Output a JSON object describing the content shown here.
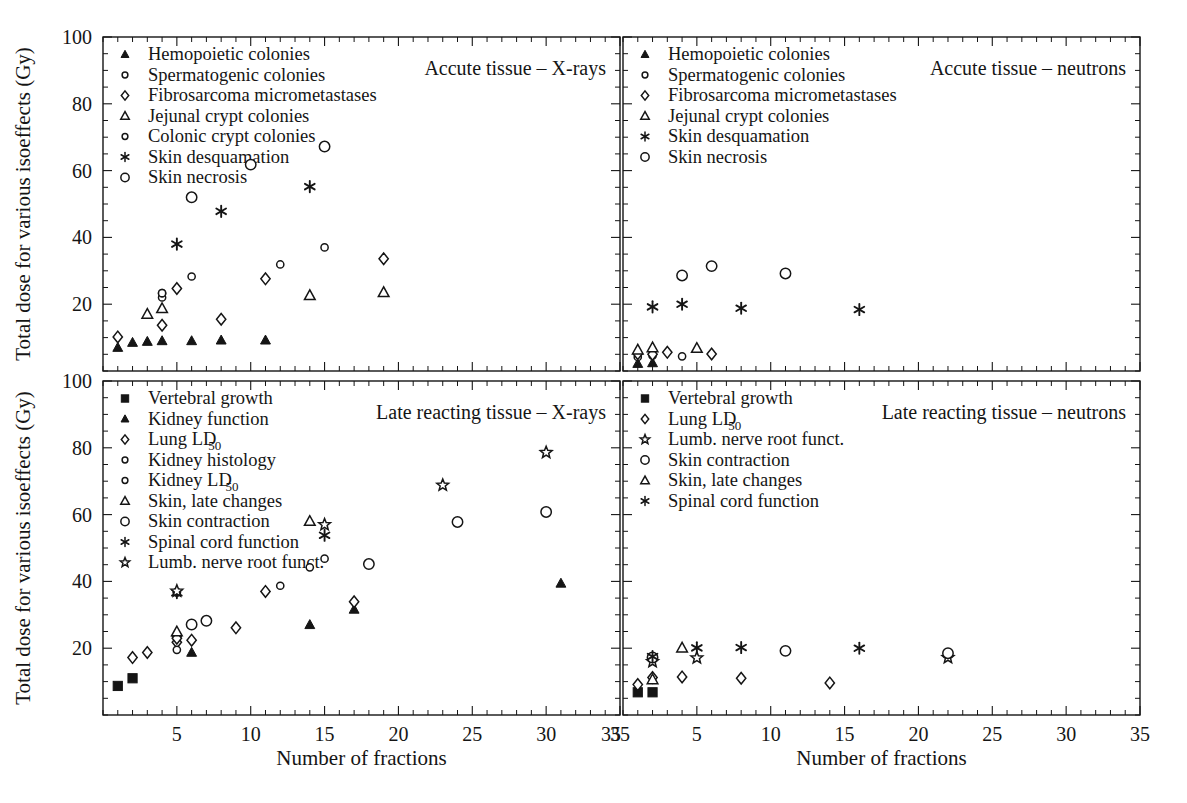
{
  "figure": {
    "width": 1187,
    "height": 803,
    "background": "#ffffff",
    "ink_color": "#151515"
  },
  "axes": {
    "x_title": "Number of fractions",
    "y_title": "Total dose for various isoeffects (Gy)",
    "x_ticks": [
      5,
      10,
      15,
      20,
      25,
      30,
      35
    ],
    "x_tick_labels": [
      "5",
      "10",
      "15",
      "20",
      "25",
      "30",
      "35"
    ],
    "x_range": [
      0,
      35
    ],
    "y_ticks": [
      20,
      40,
      60,
      80,
      100
    ],
    "y_tick_labels": [
      "20",
      "40",
      "60",
      "80",
      "100"
    ],
    "y_range": [
      0,
      100
    ],
    "x_minor_interval": 1,
    "y_minor_interval": 5,
    "grid": "off"
  },
  "chart_data": [
    {
      "type": "scatter",
      "panel": "top-left",
      "title": "Accute tissue – X-rays",
      "xlabel": "Number of fractions",
      "ylabel": "Total dose for various isoeffects (Gy)",
      "xlim": [
        0,
        35
      ],
      "ylim": [
        0,
        100
      ],
      "legend_position": "top-left",
      "series": [
        {
          "name": "Hemopoietic colonies",
          "marker": "filled-triangle",
          "points": [
            [
              1,
              7.0
            ],
            [
              2,
              8.5
            ],
            [
              3,
              8.8
            ],
            [
              4,
              9.0
            ],
            [
              6,
              9.0
            ],
            [
              8,
              9.2
            ],
            [
              11,
              9.2
            ]
          ]
        },
        {
          "name": "Spermatogenic colonies",
          "marker": "small-circle",
          "points": [
            [
              4,
              22.0
            ],
            [
              4,
              23.3
            ]
          ]
        },
        {
          "name": "Fibrosarcoma micrometastases",
          "marker": "diamond",
          "points": [
            [
              1,
              10.2
            ],
            [
              4,
              13.7
            ],
            [
              5,
              24.7
            ],
            [
              8,
              15.5
            ],
            [
              11,
              27.6
            ],
            [
              19,
              33.6
            ]
          ]
        },
        {
          "name": "Jejunal crypt colonies",
          "marker": "triangle",
          "points": [
            [
              3,
              17.0
            ],
            [
              4,
              18.7
            ],
            [
              14,
              22.6
            ],
            [
              19,
              23.5
            ]
          ]
        },
        {
          "name": "Colonic crypt colonies",
          "marker": "small-circle",
          "points": [
            [
              4,
              23.3
            ],
            [
              6,
              28.3
            ],
            [
              12,
              31.9
            ],
            [
              15,
              37.0
            ]
          ]
        },
        {
          "name": "Skin desquamation",
          "marker": "asterisk",
          "points": [
            [
              5,
              38.0
            ],
            [
              8,
              47.8
            ],
            [
              14,
              55.2
            ]
          ]
        },
        {
          "name": "Skin necrosis",
          "marker": "circle",
          "points": [
            [
              6,
              52.0
            ],
            [
              10,
              61.8
            ],
            [
              15,
              67.2
            ]
          ]
        }
      ]
    },
    {
      "type": "scatter",
      "panel": "top-right",
      "title": "Accute tissue – neutrons",
      "xlabel": "Number of fractions",
      "ylabel": "Total dose for various isoeffects (Gy)",
      "xlim": [
        0,
        35
      ],
      "ylim": [
        0,
        100
      ],
      "legend_position": "top-left",
      "series": [
        {
          "name": "Hemopoietic colonies",
          "marker": "filled-triangle",
          "points": [
            [
              1,
              2.2
            ],
            [
              2,
              2.4
            ]
          ]
        },
        {
          "name": "Spermatogenic colonies",
          "marker": "small-circle",
          "points": [
            [
              1,
              4.2
            ],
            [
              2,
              4.6
            ],
            [
              4,
              4.4
            ]
          ]
        },
        {
          "name": "Fibrosarcoma micrometastases",
          "marker": "diamond",
          "points": [
            [
              1,
              5.2
            ],
            [
              2,
              5.0
            ],
            [
              3,
              5.6
            ],
            [
              6,
              5.1
            ]
          ]
        },
        {
          "name": "Jejunal crypt colonies",
          "marker": "triangle",
          "points": [
            [
              1,
              6.3
            ],
            [
              2,
              7.0
            ],
            [
              5,
              6.8
            ]
          ]
        },
        {
          "name": "Skin desquamation",
          "marker": "asterisk",
          "points": [
            [
              2,
              19.2
            ],
            [
              4,
              20.0
            ],
            [
              8,
              18.8
            ],
            [
              16,
              18.4
            ]
          ]
        },
        {
          "name": "Skin necrosis",
          "marker": "circle",
          "points": [
            [
              4,
              28.6
            ],
            [
              6,
              31.4
            ],
            [
              11,
              29.2
            ]
          ]
        }
      ]
    },
    {
      "type": "scatter",
      "panel": "bottom-left",
      "title": "Late reacting tissue – X-rays",
      "xlabel": "Number of fractions",
      "ylabel": "Total dose for various isoeffects (Gy)",
      "xlim": [
        0,
        35
      ],
      "ylim": [
        0,
        100
      ],
      "legend_position": "top-left",
      "series": [
        {
          "name": "Vertebral growth",
          "marker": "filled-square",
          "points": [
            [
              1,
              8.7
            ],
            [
              2,
              11.0
            ]
          ]
        },
        {
          "name": "Kidney function",
          "marker": "filled-triangle",
          "points": [
            [
              5,
              24.5
            ],
            [
              6,
              18.7
            ],
            [
              14,
              27.0
            ],
            [
              17,
              31.6
            ],
            [
              31,
              39.4
            ]
          ]
        },
        {
          "name": "Lung LD50",
          "marker": "diamond",
          "points": [
            [
              2,
              17.2
            ],
            [
              3,
              18.7
            ],
            [
              5,
              21.8
            ],
            [
              5,
              23.0
            ],
            [
              6,
              22.4
            ],
            [
              9,
              26.1
            ],
            [
              11,
              37.0
            ],
            [
              17,
              33.9
            ]
          ]
        },
        {
          "name": "Kidney histology",
          "marker": "small-circle",
          "points": [
            [
              5,
              19.5
            ],
            [
              5,
              36.6
            ],
            [
              14,
              44.2
            ],
            [
              15,
              46.8
            ]
          ]
        },
        {
          "name": "Kidney LD50",
          "marker": "small-circle",
          "points": [
            [
              5,
              36.9
            ],
            [
              12,
              38.7
            ]
          ]
        },
        {
          "name": "Skin, late changes",
          "marker": "triangle",
          "points": [
            [
              5,
              24.9
            ],
            [
              14,
              58.0
            ]
          ]
        },
        {
          "name": "Skin contraction",
          "marker": "circle",
          "points": [
            [
              6,
              27.1
            ],
            [
              7,
              28.2
            ],
            [
              18,
              45.2
            ],
            [
              24,
              57.8
            ],
            [
              30,
              60.8
            ]
          ]
        },
        {
          "name": "Spinal cord function",
          "marker": "asterisk",
          "points": [
            [
              5,
              36.6
            ],
            [
              15,
              53.8
            ]
          ]
        },
        {
          "name": "Lumb. nerve root funct.",
          "marker": "star",
          "points": [
            [
              5,
              37.1
            ],
            [
              15,
              57.0
            ],
            [
              23,
              68.8
            ],
            [
              30,
              78.6
            ]
          ]
        }
      ]
    },
    {
      "type": "scatter",
      "panel": "bottom-right",
      "title": "Late reacting tissue – neutrons",
      "xlabel": "Number of fractions",
      "ylabel": "Total dose for various isoeffects (Gy)",
      "xlim": [
        0,
        35
      ],
      "ylim": [
        0,
        100
      ],
      "legend_position": "top-left",
      "series": [
        {
          "name": "Vertebral growth",
          "marker": "filled-square",
          "points": [
            [
              1,
              6.8
            ],
            [
              2,
              6.8
            ]
          ]
        },
        {
          "name": "Lung LD50",
          "marker": "diamond",
          "points": [
            [
              1,
              9.1
            ],
            [
              2,
              11.2
            ],
            [
              4,
              11.4
            ],
            [
              8,
              11.0
            ],
            [
              14,
              9.6
            ]
          ]
        },
        {
          "name": "Lumb. nerve root funct.",
          "marker": "star",
          "points": [
            [
              2,
              16.0
            ],
            [
              5,
              17.1
            ],
            [
              22,
              17.2
            ]
          ]
        },
        {
          "name": "Skin contraction",
          "marker": "circle",
          "points": [
            [
              2,
              17.2
            ],
            [
              11,
              19.2
            ],
            [
              22,
              18.5
            ]
          ]
        },
        {
          "name": "Skin, late changes",
          "marker": "triangle",
          "points": [
            [
              2,
              10.6
            ],
            [
              4,
              20.1
            ]
          ]
        },
        {
          "name": "Spinal cord function",
          "marker": "asterisk",
          "points": [
            [
              2,
              17.5
            ],
            [
              5,
              20.1
            ],
            [
              8,
              20.2
            ],
            [
              16,
              20.0
            ]
          ]
        }
      ]
    }
  ],
  "panels": {
    "top_left": {
      "title": "Accute tissue – X-rays",
      "legend": [
        {
          "marker": "filled-triangle",
          "label": "Hemopoietic colonies"
        },
        {
          "marker": "small-circle",
          "label": "Spermatogenic colonies"
        },
        {
          "marker": "diamond",
          "label": "Fibrosarcoma micrometastases"
        },
        {
          "marker": "triangle",
          "label": "Jejunal crypt colonies"
        },
        {
          "marker": "small-circle",
          "label": "Colonic crypt colonies"
        },
        {
          "marker": "asterisk",
          "label": "Skin desquamation"
        },
        {
          "marker": "circle",
          "label": "Skin necrosis"
        }
      ]
    },
    "top_right": {
      "title": "Accute tissue – neutrons",
      "legend": [
        {
          "marker": "filled-triangle",
          "label": "Hemopoietic colonies"
        },
        {
          "marker": "small-circle",
          "label": "Spermatogenic colonies"
        },
        {
          "marker": "diamond",
          "label": "Fibrosarcoma micrometastases"
        },
        {
          "marker": "triangle",
          "label": "Jejunal crypt colonies"
        },
        {
          "marker": "asterisk",
          "label": "Skin desquamation"
        },
        {
          "marker": "circle",
          "label": "Skin necrosis"
        }
      ]
    },
    "bottom_left": {
      "title": "Late reacting tissue – X-rays",
      "legend": [
        {
          "marker": "filled-square",
          "label": "Vertebral growth"
        },
        {
          "marker": "filled-triangle",
          "label": "Kidney function"
        },
        {
          "marker": "diamond",
          "label": "Lung LD",
          "sub": "50"
        },
        {
          "marker": "small-circle",
          "label": "Kidney histology"
        },
        {
          "marker": "small-circle",
          "label": "Kidney LD",
          "sub": "50"
        },
        {
          "marker": "triangle",
          "label": "Skin, late changes"
        },
        {
          "marker": "circle",
          "label": "Skin contraction"
        },
        {
          "marker": "asterisk",
          "label": "Spinal cord function"
        },
        {
          "marker": "star",
          "label": "Lumb. nerve root funct."
        }
      ]
    },
    "bottom_right": {
      "title": "Late reacting tissue – neutrons",
      "legend": [
        {
          "marker": "filled-square",
          "label": "Vertebral growth"
        },
        {
          "marker": "diamond",
          "label": "Lung LD",
          "sub": "50"
        },
        {
          "marker": "star",
          "label": "Lumb. nerve root funct."
        },
        {
          "marker": "circle",
          "label": "Skin contraction"
        },
        {
          "marker": "triangle",
          "label": "Skin, late changes"
        },
        {
          "marker": "asterisk",
          "label": "Spinal cord function"
        }
      ]
    }
  }
}
